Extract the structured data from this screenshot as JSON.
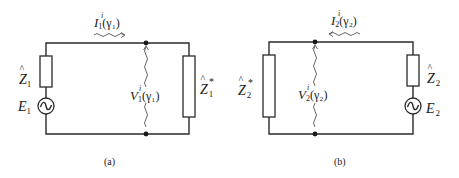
{
  "figure": {
    "panels": [
      {
        "id": "a",
        "caption": "(a)",
        "source_impedance": {
          "base": "Z",
          "hat": "^",
          "sub": "1"
        },
        "source": {
          "base": "E",
          "sub": "1"
        },
        "load_impedance": {
          "base": "Z",
          "hat": "^",
          "sub": "1",
          "sup": "*"
        },
        "current": {
          "base": "I",
          "sub": "1",
          "sup": "i",
          "arg": "(γ₁)",
          "direction": "right"
        },
        "voltage": {
          "base": "V",
          "sub": "1",
          "sup": "i",
          "arg": "(γ₁)"
        }
      },
      {
        "id": "b",
        "caption": "(b)",
        "source_impedance": {
          "base": "Z",
          "hat": "^",
          "sub": "2"
        },
        "source": {
          "base": "E",
          "sub": "2"
        },
        "load_impedance": {
          "base": "Z",
          "hat": "^",
          "sub": "2",
          "sup": "*"
        },
        "current": {
          "base": "I",
          "sub": "2",
          "sup": "i",
          "arg": "(γ₂)",
          "direction": "left"
        },
        "voltage": {
          "base": "V",
          "sub": "2",
          "sup": "i",
          "arg": "(γ₂)"
        }
      }
    ],
    "colors": {
      "line": "#2a2a2a",
      "text": "#1a1a1a",
      "wavy": "#555555",
      "background": "#ffffff"
    }
  }
}
